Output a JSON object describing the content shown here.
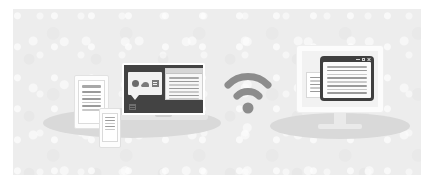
{
  "illustration": {
    "title": "Wireless content sharing between devices",
    "background_color": "#ffffff",
    "canvas_color": "#ededed",
    "shadow_color": "#d9d9d9",
    "accent_dark": "#434343",
    "accent_mid": "#8c8c8c",
    "line_color": "#c9c9c9"
  },
  "devices": {
    "tablet": {
      "name": "tablet",
      "document": {
        "heading_lines": 1,
        "body_lines": 6
      }
    },
    "phone": {
      "name": "smartphone",
      "document": {
        "heading_lines": 1,
        "body_lines": 4
      }
    },
    "laptop": {
      "name": "laptop",
      "screen_color": "#434343",
      "app_panel": {
        "name": "app-bubble",
        "icons": [
          {
            "name": "circle-app-icon",
            "shape": "circle"
          },
          {
            "name": "cloud-app-icon",
            "shape": "cloud"
          },
          {
            "name": "document-app-icon",
            "shape": "document"
          }
        ]
      },
      "mini_icon": {
        "name": "mini-document-icon"
      },
      "document_window": {
        "heading_lines": 1,
        "body_lines": 6
      }
    },
    "monitor": {
      "name": "desktop-monitor",
      "screen_color": "#f2f2f2",
      "background_document": {
        "body_lines": 5
      },
      "window": {
        "frame_color": "#3f3f3f",
        "title_bar_buttons": [
          {
            "name": "minimize-button",
            "glyph": "minimize"
          },
          {
            "name": "maximize-button",
            "glyph": "maximize"
          },
          {
            "name": "close-button",
            "glyph": "close"
          }
        ],
        "document": {
          "heading_lines": 1,
          "body_lines": 7
        }
      }
    }
  },
  "wifi": {
    "name": "wifi-signal-icon",
    "color": "#8c8c8c",
    "arcs": 2,
    "has_dot": true
  }
}
